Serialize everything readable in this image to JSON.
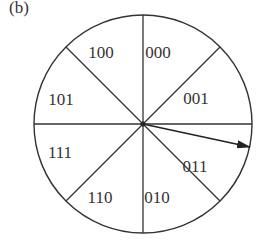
{
  "figure": {
    "label": "(b)",
    "center": [
      143,
      124
    ],
    "radius": 109,
    "stroke_color": "#333333",
    "segments": [
      {
        "label": "000",
        "x": 158,
        "y": 58
      },
      {
        "label": "001",
        "x": 196,
        "y": 104
      },
      {
        "label": "011",
        "x": 195,
        "y": 172
      },
      {
        "label": "010",
        "x": 157,
        "y": 203
      },
      {
        "label": "110",
        "x": 100,
        "y": 203
      },
      {
        "label": "111",
        "x": 60,
        "y": 158
      },
      {
        "label": "101",
        "x": 61,
        "y": 105
      },
      {
        "label": "100",
        "x": 101,
        "y": 58
      }
    ],
    "pointer": {
      "from": [
        143,
        124
      ],
      "to": [
        250,
        147
      ]
    }
  }
}
